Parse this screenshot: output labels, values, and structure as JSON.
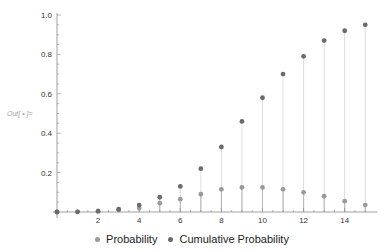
{
  "output_label": "Out[ • ]=",
  "chart_data": {
    "type": "scatter",
    "title": "",
    "xlabel": "",
    "ylabel": "",
    "xlim": [
      0,
      15.5
    ],
    "ylim": [
      0,
      1.0
    ],
    "x_ticks": [
      2,
      4,
      6,
      8,
      10,
      12,
      14
    ],
    "y_ticks": [
      0.2,
      0.4,
      0.6,
      0.8,
      1.0
    ],
    "grid": false,
    "legend_position": "bottom",
    "filling": "drop lines to axis",
    "x": [
      0,
      1,
      2,
      3,
      4,
      5,
      6,
      7,
      8,
      9,
      10,
      11,
      12,
      13,
      14,
      15
    ],
    "series": [
      {
        "name": "Probability",
        "color": "#9a9a9a",
        "values": [
          0.0,
          0.001,
          0.003,
          0.01,
          0.02,
          0.045,
          0.065,
          0.09,
          0.115,
          0.125,
          0.125,
          0.115,
          0.1,
          0.08,
          0.055,
          0.035
        ]
      },
      {
        "name": "Cumulative Probability",
        "color": "#6b6b6b",
        "values": [
          0.0,
          0.001,
          0.004,
          0.014,
          0.035,
          0.075,
          0.13,
          0.22,
          0.33,
          0.46,
          0.58,
          0.7,
          0.79,
          0.87,
          0.92,
          0.95
        ]
      }
    ]
  },
  "legend": {
    "items": [
      {
        "label": "Probability",
        "color": "#9a9a9a"
      },
      {
        "label": "Cumulative Probability",
        "color": "#6b6b6b"
      }
    ]
  }
}
